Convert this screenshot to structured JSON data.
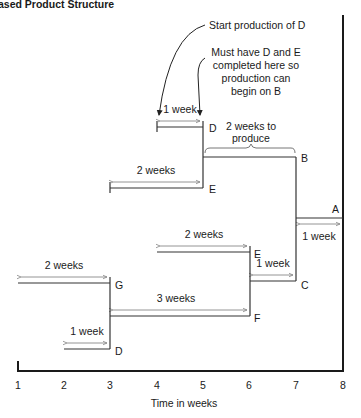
{
  "header": {
    "title": "ased Product Structure"
  },
  "annotations": {
    "start_d": "Start production of D",
    "must_have": [
      "Must have D and E",
      "completed here so",
      "production can",
      "begin on B"
    ],
    "two_weeks_to_produce": [
      "2 weeks to",
      "produce"
    ]
  },
  "axis": {
    "ticks": [
      "1",
      "2",
      "3",
      "4",
      "5",
      "6",
      "7",
      "8"
    ],
    "xlabel": "Time in weeks"
  },
  "items": [
    {
      "name": "A",
      "duration": "1 week",
      "start": 7,
      "end": 8
    },
    {
      "name": "B",
      "duration": "2 weeks",
      "start": 5,
      "end": 7
    },
    {
      "name": "C",
      "duration": "1 week",
      "start": 6,
      "end": 7
    },
    {
      "name": "D",
      "duration": "1 week",
      "start": 4,
      "end": 5
    },
    {
      "name": "E",
      "duration": "2 weeks",
      "start": 3,
      "end": 5
    },
    {
      "name": "E",
      "duration": "2 weeks",
      "start": 4,
      "end": 6
    },
    {
      "name": "F",
      "duration": "3 weeks",
      "start": 3,
      "end": 6
    },
    {
      "name": "G",
      "duration": "2 weeks",
      "start": 1,
      "end": 3
    },
    {
      "name": "D",
      "duration": "1 week",
      "start": 2,
      "end": 3
    }
  ],
  "labels": {
    "a": "A",
    "b": "B",
    "c": "C",
    "d_top": "D",
    "e_top": "E",
    "e_mid": "E",
    "f": "F",
    "g": "G",
    "d_bottom": "D",
    "dur_a": "1 week",
    "dur_c": "1 week",
    "dur_d_top": "1 week",
    "dur_e_top": "2 weeks",
    "dur_e_mid": "2 weeks",
    "dur_f": "3 weeks",
    "dur_g": "2 weeks",
    "dur_d_bottom": "1 week"
  }
}
